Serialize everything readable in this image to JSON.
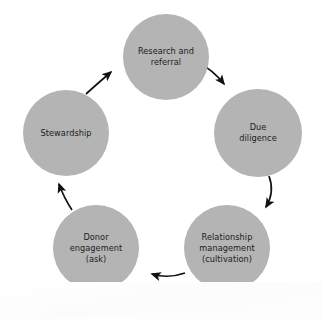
{
  "diagram": {
    "type": "cycle",
    "title": "",
    "direction": "clockwise",
    "background_color": "#ffffff",
    "node_fill_color": "#b4b4b4",
    "node_text_color": "#1c1c1c",
    "arrow_color": "#111111",
    "nodes": [
      {
        "id": "research-and-referral",
        "label": "Research and\nreferral",
        "cx": 166,
        "cy": 57,
        "r": 43
      },
      {
        "id": "due-diligence",
        "label": "Due\ndiligence",
        "cx": 258,
        "cy": 133,
        "r": 44
      },
      {
        "id": "relationship-management",
        "label": "Relationship\nmanagement\n(cultivation)",
        "cx": 227,
        "cy": 248,
        "r": 43
      },
      {
        "id": "donor-engagement",
        "label": "Donor\nengagement\n(ask)",
        "cx": 96,
        "cy": 248,
        "r": 43
      },
      {
        "id": "stewardship",
        "label": "Stewardship",
        "cx": 66,
        "cy": 133,
        "r": 43
      }
    ],
    "arrows": [
      {
        "id": "arrow-research-to-due-diligence",
        "from": "research-and-referral",
        "to": "due-diligence"
      },
      {
        "id": "arrow-due-diligence-to-relationship",
        "from": "due-diligence",
        "to": "relationship-management"
      },
      {
        "id": "arrow-relationship-to-donor",
        "from": "relationship-management",
        "to": "donor-engagement"
      },
      {
        "id": "arrow-donor-to-stewardship",
        "from": "donor-engagement",
        "to": "stewardship"
      },
      {
        "id": "arrow-stewardship-to-research",
        "from": "stewardship",
        "to": "research-and-referral"
      }
    ]
  }
}
